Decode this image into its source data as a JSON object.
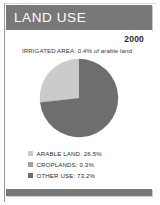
{
  "header": {
    "title": "LAND USE",
    "bar_color": "#787878",
    "title_color": "#ffffff"
  },
  "panel": {
    "year": "2000",
    "irrigated_note": "IRRIGATED AREA: 0.4% of arable land"
  },
  "chart_data": {
    "type": "pie",
    "title": "LAND USE",
    "subtitle": "IRRIGATED AREA: 0.4% of arable land",
    "year": "2000",
    "units": "percent of total land area",
    "categories": [
      "ARABLE LAND",
      "CROPLANDS",
      "OTHER USE"
    ],
    "values": [
      26.5,
      0.3,
      73.2
    ],
    "labels": [
      "ARABLE LAND: 26.5%",
      "CROPLANDS: 0.3%",
      "OTHER USE: 73.2%"
    ],
    "colors": [
      "#cbcbcb",
      "#a0a0a0",
      "#6e6e6e"
    ],
    "start_angle_deg": 0,
    "direction": "counterclockwise",
    "legend_position": "bottom-left",
    "grid": false,
    "annotations": [
      "IRRIGATED AREA: 0.4% of arable land"
    ]
  },
  "legend": [
    {
      "label": "ARABLE LAND: 26.5%",
      "color": "#cbcbcb",
      "value": 26.5
    },
    {
      "label": "CROPLANDS: 0.3%",
      "color": "#a0a0a0",
      "value": 0.3
    },
    {
      "label": "OTHER USE: 73.2%",
      "color": "#6e6e6e",
      "value": 73.2
    }
  ],
  "footer": {
    "bar_color": "#787878"
  }
}
